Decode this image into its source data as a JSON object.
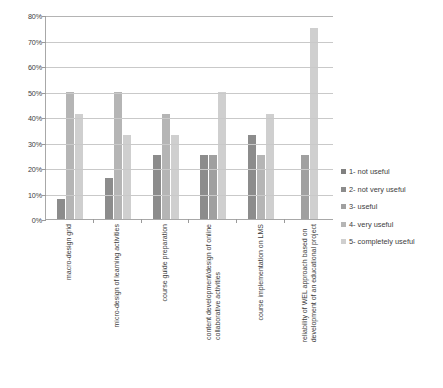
{
  "chart_data": {
    "type": "bar",
    "title": "",
    "xlabel": "",
    "ylabel": "",
    "ylim": [
      0,
      80
    ],
    "grid": true,
    "legend_position": "right",
    "y_ticks": [
      "0%",
      "10%",
      "20%",
      "30%",
      "40%",
      "50%",
      "60%",
      "70%",
      "80%"
    ],
    "y_tick_values": [
      0,
      10,
      20,
      30,
      40,
      50,
      60,
      70,
      80
    ],
    "categories": [
      "macro-design grid",
      "micro-design of learning activities",
      "course guide preparation",
      "content development/design of online collaborative activities",
      "course implementation on LMS",
      "reliability of WEL approach based on development of an educational project"
    ],
    "category_lines": [
      [
        "macro-design grid"
      ],
      [
        "micro-design of learning activities"
      ],
      [
        "course guide preparation"
      ],
      [
        "content development/design of online",
        "collaborative activities"
      ],
      [
        "course implementation on LMS"
      ],
      [
        "reliability of WEL approach based on",
        "development of an educational project"
      ]
    ],
    "series": [
      {
        "name": "1- not useful",
        "color": "#808080",
        "values": [
          0,
          0,
          0,
          0,
          0,
          0
        ]
      },
      {
        "name": "2- not very useful",
        "color": "#8c8c8c",
        "values": [
          8,
          16,
          25,
          25,
          33,
          0
        ]
      },
      {
        "name": "3- useful",
        "color": "#a0a0a0",
        "values": [
          0,
          0,
          0,
          25,
          0,
          25
        ]
      },
      {
        "name": "4- very useful",
        "color": "#b5b5b5",
        "values": [
          50,
          50,
          41,
          0,
          25,
          0
        ]
      },
      {
        "name": "5- completely useful",
        "color": "#cfcfcf",
        "values": [
          41,
          33,
          33,
          50,
          41,
          75
        ]
      }
    ]
  },
  "legend": {
    "items": [
      {
        "label": "1- not useful",
        "color": "#808080"
      },
      {
        "label": "2- not very useful",
        "color": "#8c8c8c"
      },
      {
        "label": "3- useful",
        "color": "#a0a0a0"
      },
      {
        "label": "4- very useful",
        "color": "#b5b5b5"
      },
      {
        "label": "5- completely useful",
        "color": "#cfcfcf"
      }
    ]
  }
}
